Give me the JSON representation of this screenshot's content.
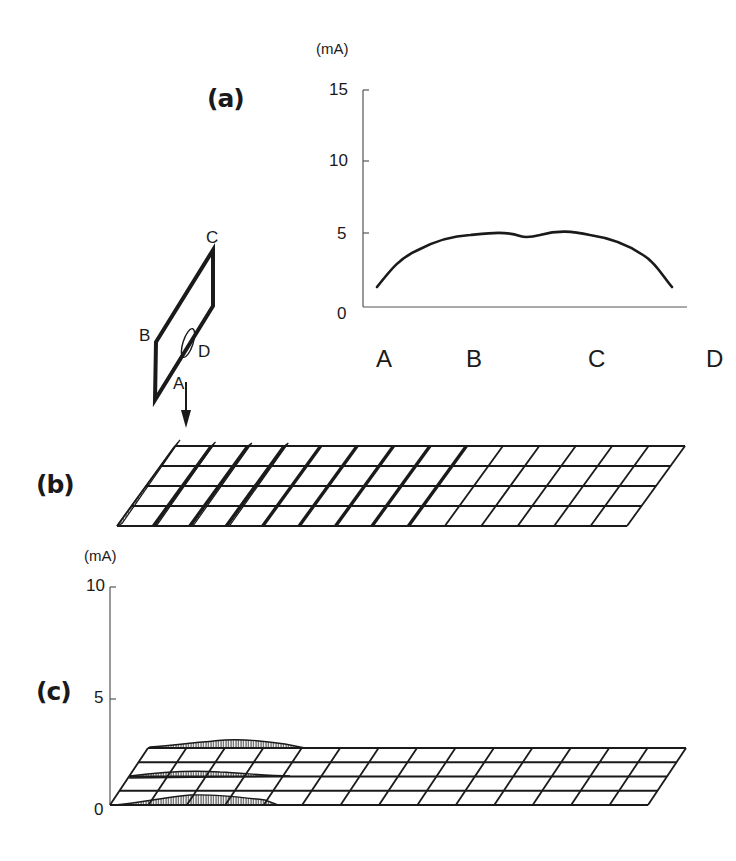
{
  "figure": {
    "panels": [
      {
        "id": "a",
        "label": "(a)"
      },
      {
        "id": "b",
        "label": "(b)"
      },
      {
        "id": "c",
        "label": "(c)"
      }
    ]
  },
  "panel_a": {
    "label": "(a)",
    "unit": "(mA)",
    "y_ticks": [
      "15",
      "10",
      "5",
      "0"
    ],
    "x_labels": [
      "A",
      "B",
      "C",
      "D"
    ]
  },
  "loop_diagram": {
    "labels": {
      "A": "A",
      "B": "B",
      "C": "C",
      "D": "D"
    },
    "description": "rectangular loop ABCD with current probe (ellipse) near D and downward arrow at A"
  },
  "panel_b": {
    "label": "(b)",
    "grid_columns": 14,
    "grid_rows": 4,
    "description": "3D mesh with hatched current ridges concentrated near the left edge"
  },
  "panel_c": {
    "label": "(c)",
    "unit": "(mA)",
    "y_ticks": [
      "10",
      "5",
      "0"
    ],
    "grid_columns": 14,
    "grid_rows": 4,
    "description": "3D mesh with small hatched current bump over left columns"
  },
  "chart_data": [
    {
      "type": "line",
      "title": "(a)",
      "xlabel": "",
      "ylabel": "(mA)",
      "ylim": [
        0,
        15
      ],
      "y_ticks": [
        0,
        5,
        10,
        15
      ],
      "categories": [
        "A",
        "B",
        "C",
        "D"
      ],
      "x": [
        0.0,
        0.1,
        0.2,
        0.3,
        0.4,
        0.5,
        0.6,
        0.7,
        0.8,
        0.9,
        1.0
      ],
      "series": [
        {
          "name": "current along loop A-B-C-D",
          "values": [
            1.4,
            3.5,
            4.4,
            4.9,
            5.1,
            4.8,
            5.1,
            4.9,
            4.4,
            3.5,
            1.4
          ]
        }
      ],
      "grid": false,
      "legend": null
    },
    {
      "type": "heatmap",
      "title": "(c)",
      "ylabel": "(mA)",
      "ylim": [
        0,
        10
      ],
      "y_ticks": [
        0,
        5,
        10
      ],
      "grid_columns": 14,
      "grid_rows": 4,
      "note": "surface current nearly flat (~0-1 mA), small bump ~1 mA over columns 1-5"
    }
  ]
}
